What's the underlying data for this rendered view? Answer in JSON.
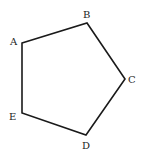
{
  "diagram": {
    "stroke_color": "#1a1a1a",
    "vertices": [
      {
        "name": "A",
        "x": 22,
        "y": 43,
        "label_x": 10,
        "label_y": 45
      },
      {
        "name": "B",
        "x": 87,
        "y": 23,
        "label_x": 83,
        "label_y": 18
      },
      {
        "name": "C",
        "x": 125,
        "y": 79,
        "label_x": 128,
        "label_y": 83
      },
      {
        "name": "D",
        "x": 86,
        "y": 135,
        "label_x": 82,
        "label_y": 149
      },
      {
        "name": "E",
        "x": 22,
        "y": 113,
        "label_x": 9,
        "label_y": 120
      }
    ]
  }
}
